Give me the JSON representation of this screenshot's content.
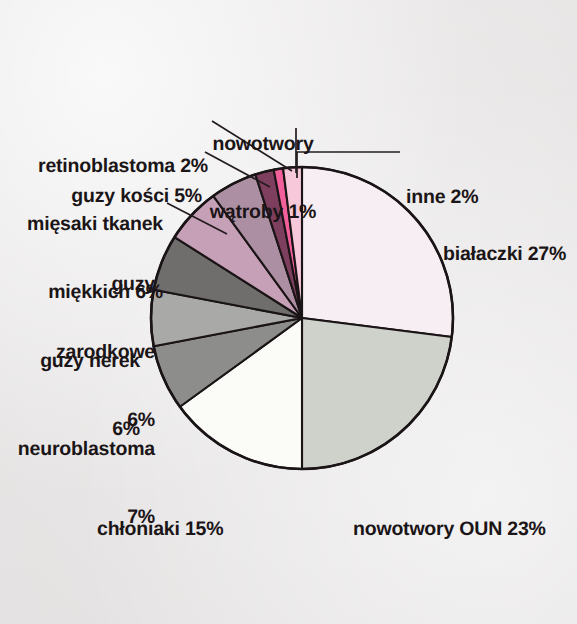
{
  "figure": {
    "background_color": "#eeecec",
    "outline_color": "#1a1416",
    "text_color": "#1b1517"
  },
  "chart_data": {
    "type": "pie",
    "title": "",
    "subtitle": "",
    "xlabel": "",
    "ylabel": "",
    "units": "percent",
    "start_angle_deg": 0,
    "direction": "clockwise",
    "legend": "none (labels placed around pie with leader lines)",
    "grid": false,
    "total": 100,
    "categories": [
      "białaczki",
      "nowotwory OUN",
      "chłoniaki",
      "neuroblastoma",
      "guzy nerek",
      "guzy zarodkowe",
      "mięsaki tkanek miękkich",
      "guzy kości",
      "retinoblastoma",
      "nowotwory wątroby",
      "inne"
    ],
    "values": [
      27,
      23,
      15,
      7,
      6,
      6,
      6,
      5,
      2,
      1,
      2
    ],
    "colors": [
      "#f7eef3",
      "#cfd2cb",
      "#fbfbf8",
      "#8d8d8c",
      "#a9a9a7",
      "#6f6e6d",
      "#c6a0b6",
      "#ad8fa3",
      "#7d3f5d",
      "#f2609b",
      "#f6c8da"
    ],
    "slices": [
      {
        "label": "białaczki",
        "value": 27,
        "text": "białaczki 27%",
        "color": "#f7eef3"
      },
      {
        "label": "nowotwory OUN",
        "value": 23,
        "text": "nowotwory OUN 23%",
        "color": "#cfd2cb"
      },
      {
        "label": "chłoniaki",
        "value": 15,
        "text": "chłoniaki 15%",
        "color": "#fbfbf8"
      },
      {
        "label": "neuroblastoma",
        "value": 7,
        "text": "neuroblastoma 7%",
        "color": "#8d8d8c"
      },
      {
        "label": "guzy nerek",
        "value": 6,
        "text": "guzy nerek 6%",
        "color": "#a9a9a7"
      },
      {
        "label": "guzy zarodkowe",
        "value": 6,
        "text": "guzy zarodkowe 6%",
        "color": "#6f6e6d"
      },
      {
        "label": "mięsaki tkanek miękkich",
        "value": 6,
        "text": "mięsaki tkanek miękkich 6%",
        "color": "#c6a0b6"
      },
      {
        "label": "guzy kości",
        "value": 5,
        "text": "guzy kości 5%",
        "color": "#ad8fa3"
      },
      {
        "label": "retinoblastoma",
        "value": 2,
        "text": "retinoblastoma 2%",
        "color": "#7d3f5d"
      },
      {
        "label": "nowotwory wątroby",
        "value": 1,
        "text": "nowotwory wątroby 1%",
        "color": "#f2609b"
      },
      {
        "label": "inne",
        "value": 2,
        "text": "inne 2%",
        "color": "#f6c8da"
      }
    ]
  },
  "labels": {
    "bialaczki": {
      "line1": "białaczki 27%"
    },
    "nowotwory_oun": {
      "line1": "nowotwory OUN 23%"
    },
    "chloniaki": {
      "line1": "chłoniaki 15%"
    },
    "neuroblastoma": {
      "line1": "neuroblastoma",
      "line2": "7%"
    },
    "guzy_nerek": {
      "line1": "guzy nerek",
      "line2": "6%"
    },
    "guzy_zarodkowe": {
      "line1": "guzy",
      "line2": "zarodkowe",
      "line3": "6%"
    },
    "miesaki": {
      "line1": "mięsaki tkanek",
      "line2": "miękkich 6%"
    },
    "guzy_kosci": {
      "line1": "guzy kości 5%"
    },
    "retinoblastoma": {
      "line1": "retinoblastoma 2%"
    },
    "nowotwory_watroby": {
      "line1": "nowotwory",
      "line2": "wątroby 1%"
    },
    "inne": {
      "line1": "inne 2%"
    }
  }
}
